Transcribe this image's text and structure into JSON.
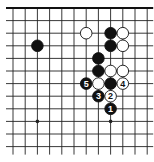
{
  "diagram": {
    "type": "go-board-fragment",
    "grid": {
      "columns": 12,
      "rows": 12,
      "origin_x": 13,
      "origin_y": 8,
      "step_x": 12.2,
      "step_y": 12.6,
      "top_edge": true,
      "left_edge": false,
      "right_edge": false,
      "bottom_edge": false,
      "line_color": "#222222",
      "edge_color": "#111111"
    },
    "star_points": [
      {
        "col": 2,
        "row": 9
      },
      {
        "col": 8,
        "row": 9
      }
    ],
    "stones": [
      {
        "color": "black",
        "col": 2,
        "row": 3,
        "label": ""
      },
      {
        "color": "white",
        "col": 6,
        "row": 2,
        "label": ""
      },
      {
        "color": "black",
        "col": 8,
        "row": 2,
        "label": ""
      },
      {
        "color": "white",
        "col": 9,
        "row": 2,
        "label": ""
      },
      {
        "color": "black",
        "col": 8,
        "row": 3,
        "label": ""
      },
      {
        "color": "white",
        "col": 9,
        "row": 3,
        "label": ""
      },
      {
        "color": "black",
        "col": 7,
        "row": 4,
        "label": ""
      },
      {
        "color": "black",
        "col": 7,
        "row": 5,
        "label": ""
      },
      {
        "color": "white",
        "col": 8,
        "row": 5,
        "label": ""
      },
      {
        "color": "white",
        "col": 9,
        "row": 5,
        "label": ""
      },
      {
        "color": "black",
        "col": 6,
        "row": 6,
        "label": "5"
      },
      {
        "color": "white",
        "col": 7,
        "row": 6,
        "label": ""
      },
      {
        "color": "black",
        "col": 8,
        "row": 6,
        "label": ""
      },
      {
        "color": "white",
        "col": 9,
        "row": 6,
        "label": "4"
      },
      {
        "color": "black",
        "col": 7,
        "row": 7,
        "label": "3"
      },
      {
        "color": "white",
        "col": 8,
        "row": 7,
        "label": "2"
      },
      {
        "color": "black",
        "col": 8,
        "row": 8,
        "label": "1"
      }
    ],
    "colors": {
      "black_stone": "#111111",
      "white_stone": "#ffffff",
      "stone_outline": "#111111",
      "background": "#ffffff"
    }
  }
}
